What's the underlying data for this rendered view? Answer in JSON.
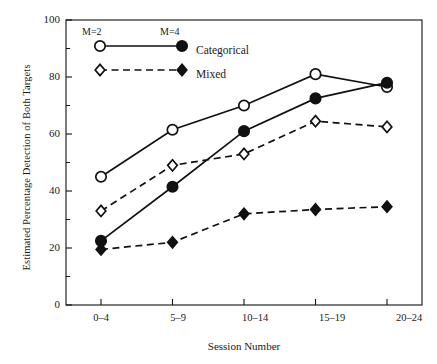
{
  "chart_data": {
    "type": "line",
    "title": "",
    "xlabel": "Session Number",
    "ylabel": "Estimated Percentage Detection of Both Targets",
    "categories": [
      "0–4",
      "5–9",
      "10–14",
      "15–19",
      "20–24"
    ],
    "ylim": [
      0,
      100
    ],
    "yticks": [
      0,
      20,
      40,
      60,
      80,
      100
    ],
    "yticklabels": [
      "0",
      "20",
      "40",
      "60",
      "80",
      "100"
    ],
    "yminorticks": [
      10,
      30,
      50,
      70,
      90
    ],
    "grid": false,
    "legend_position": "upper-left-inside",
    "series": [
      {
        "name": "Categorical M=2",
        "condition": "Categorical",
        "set_size": "M=2",
        "marker": "open-circle",
        "linestyle": "solid",
        "values": [
          45,
          61.5,
          70,
          81,
          76.5
        ]
      },
      {
        "name": "Categorical M=4",
        "condition": "Categorical",
        "set_size": "M=4",
        "marker": "filled-circle",
        "linestyle": "solid",
        "values": [
          22.5,
          41.5,
          61,
          72.5,
          78
        ]
      },
      {
        "name": "Mixed M=2",
        "condition": "Mixed",
        "set_size": "M=2",
        "marker": "open-diamond",
        "linestyle": "dashed",
        "values": [
          33,
          49,
          53,
          64.5,
          62.5
        ]
      },
      {
        "name": "Mixed M=4",
        "condition": "Mixed",
        "set_size": "M=4",
        "marker": "filled-diamond",
        "linestyle": "dashed",
        "values": [
          19.5,
          22,
          32,
          33.5,
          34.5
        ]
      }
    ],
    "annotations": [
      {
        "text": "M=2",
        "role": "legend-column-header"
      },
      {
        "text": "M=4",
        "role": "legend-column-header"
      }
    ],
    "legend": [
      {
        "label": "Categorical",
        "linestyle": "solid",
        "open_marker": "open-circle",
        "filled_marker": "filled-circle"
      },
      {
        "label": "Mixed",
        "linestyle": "dashed",
        "open_marker": "open-diamond",
        "filled_marker": "filled-diamond"
      }
    ],
    "colors": {
      "ink": "#111111",
      "background": "#ffffff"
    }
  }
}
